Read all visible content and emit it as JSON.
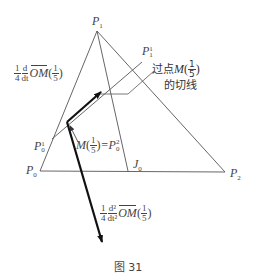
{
  "figure": {
    "caption": "图 31",
    "colors": {
      "line": "#555555",
      "thick": "#111111",
      "text": "#444444",
      "background": "#ffffff"
    }
  },
  "points": {
    "P0": {
      "label": "P",
      "sub": "0",
      "x": 40,
      "y": 171
    },
    "P1": {
      "label": "P",
      "sub": "1",
      "x": 97,
      "y": 31
    },
    "P2": {
      "label": "P",
      "sub": "2",
      "x": 225,
      "y": 172
    },
    "J0": {
      "label": "J",
      "sub": "0",
      "x": 128,
      "y": 171
    },
    "P0_1": {
      "label": "P",
      "sub": "0",
      "sup": "1",
      "x": 52,
      "y": 139
    },
    "P1_1": {
      "label": "P",
      "sub": "1",
      "sup": "1",
      "x": 142,
      "y": 62
    },
    "M": {
      "x": 67,
      "y": 122
    }
  },
  "labels": {
    "P1": "P",
    "P1_sub": "1",
    "P1_1": "P",
    "P1_1_sub": "1",
    "P1_1_sup": "1",
    "P0_1": "P",
    "P0_1_sub": "0",
    "P0_1_sup": "1",
    "P0": "P",
    "P0_sub": "0",
    "P2": "P",
    "P2_sub": "2",
    "J0": "J",
    "J0_sub": "0",
    "tangent_label_line1_prefix": "过点 ",
    "tangent_label_M": "M",
    "tangent_label_frac_num": "1",
    "tangent_label_frac_den": "5",
    "tangent_label_line2": "的切线",
    "M_label": "M",
    "M_frac_num": "1",
    "M_frac_den": "5",
    "M_eq": "=P",
    "M_eq_sub": "0",
    "M_eq_sup": "2"
  },
  "vectors": {
    "first_derivative": {
      "coef_num": "1",
      "coef_den": "4",
      "d_num": "d",
      "d_den": "dt",
      "vec": "OM",
      "arg_num": "1",
      "arg_den": "5"
    },
    "second_derivative": {
      "coef_num": "1",
      "coef_den": "4",
      "d_num": "d²",
      "d_den": "dt²",
      "vec": "OM",
      "arg_num": "1",
      "arg_den": "5"
    }
  }
}
